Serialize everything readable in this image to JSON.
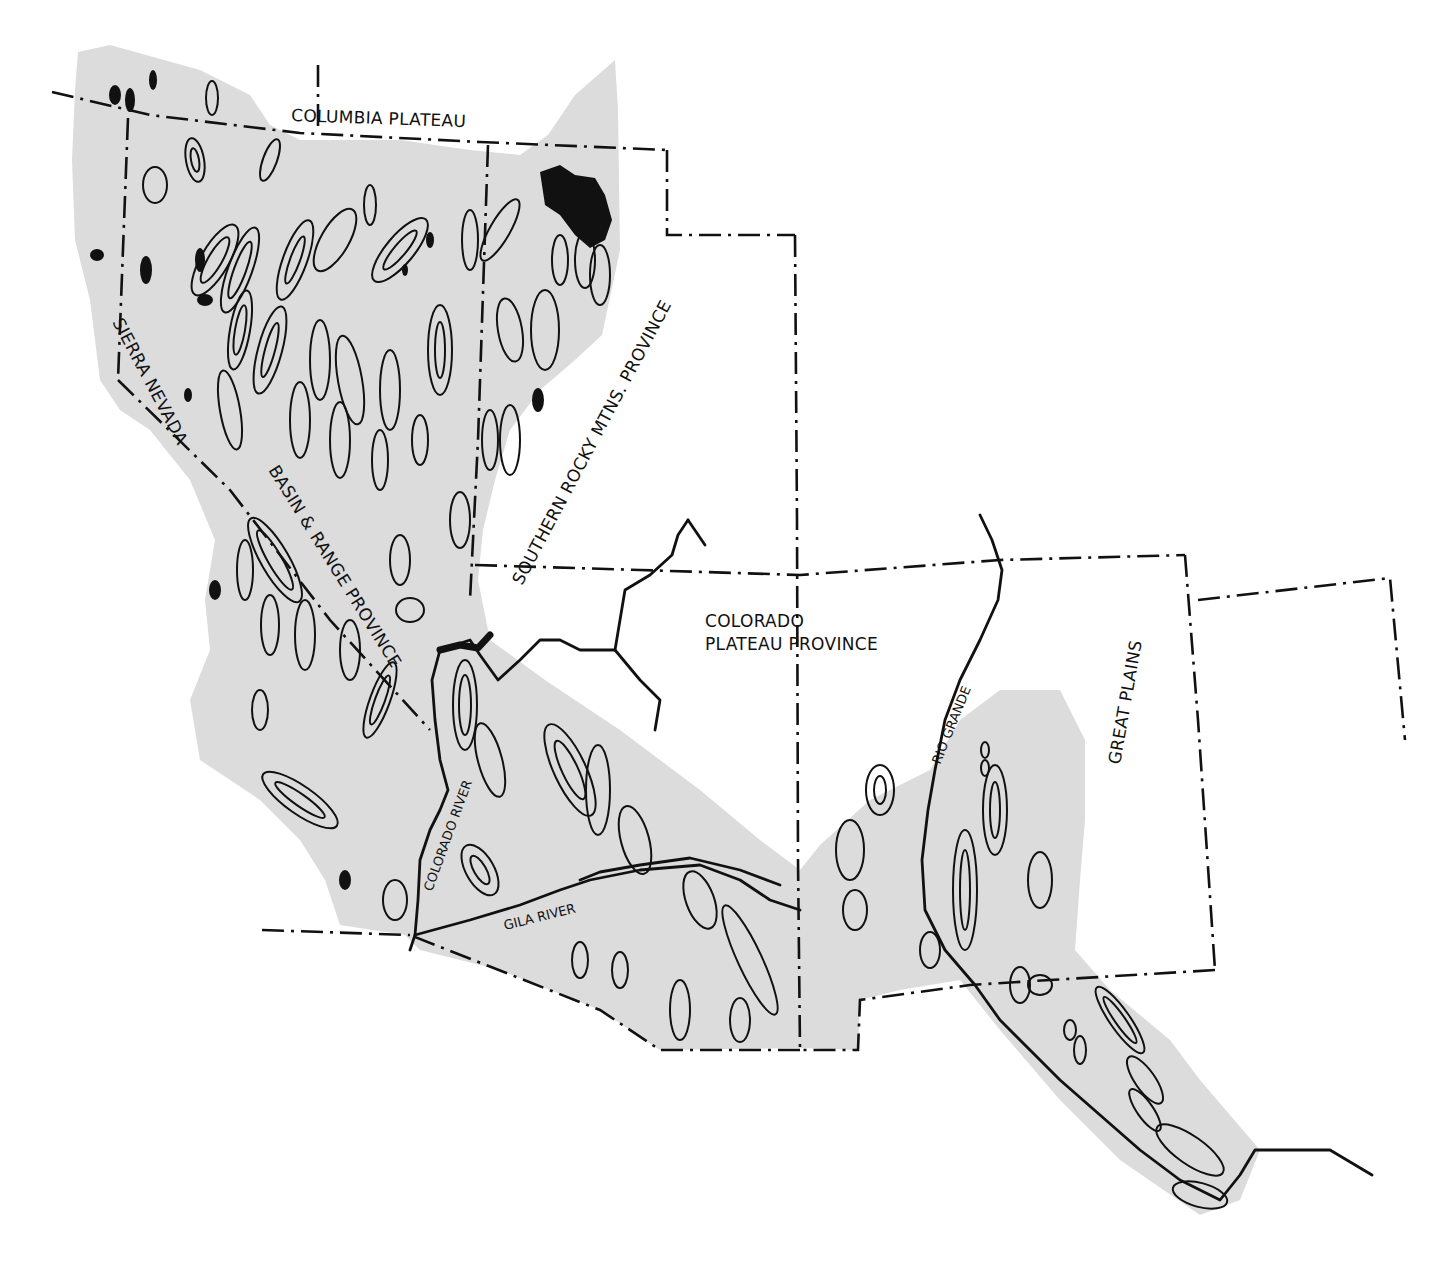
{
  "map": {
    "subject": "Basin and Range physiographic province and adjacent provinces, southwestern United States",
    "colors": {
      "shaded_region": "#dcdcdc",
      "ink": "#111111",
      "background": "#ffffff"
    },
    "legend_symbols": {
      "shaded_area": "Basin & Range province extent",
      "dash_dot_lines": "province / state boundaries",
      "solid_thick_lines": "rivers",
      "closed_contours": "mountain ranges",
      "solid_black_areas": "high peaks / volcanic areas"
    },
    "labels": {
      "columbia_plateau": "COLUMBIA PLATEAU",
      "sierra_nevada": "SIERRA NEVADA",
      "basin_range": "BASIN & RANGE PROVINCE",
      "southern_rocky": "SOUTHERN ROCKY MTNS. PROVINCE",
      "colorado_plateau_line1": "COLORADO",
      "colorado_plateau_line2": "PLATEAU PROVINCE",
      "great_plains": "GREAT PLAINS",
      "rio_grande": "RIO GRANDE",
      "colorado_river": "COLORADO RIVER",
      "gila_river": "GILA RIVER"
    }
  }
}
